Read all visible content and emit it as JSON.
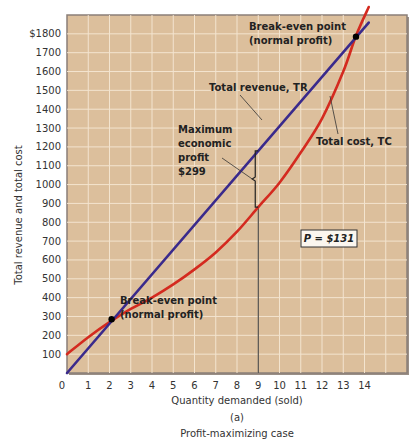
{
  "chart_data": {
    "type": "line",
    "title": "Profit-maximizing case",
    "panel_label": "(a)",
    "xlabel": "Quantity demanded (sold)",
    "ylabel": "Total revenue and total cost",
    "xlim": [
      0,
      16
    ],
    "ylim": [
      0,
      1900
    ],
    "x_ticks": [
      "0",
      "1",
      "2",
      "3",
      "4",
      "5",
      "6",
      "7",
      "8",
      "9",
      "10",
      "11",
      "12",
      "13",
      "14"
    ],
    "y_ticks": [
      "100",
      "200",
      "300",
      "400",
      "500",
      "600",
      "700",
      "800",
      "900",
      "1000",
      "1100",
      "1200",
      "1300",
      "1400",
      "1500",
      "1600",
      "1700",
      "$1800"
    ],
    "grid": true,
    "background_color": "#dcbf9c",
    "series": [
      {
        "name": "Total revenue, TR",
        "color": "#3a2a8c",
        "x": [
          0,
          14.2
        ],
        "y": [
          0,
          1860
        ]
      },
      {
        "name": "Total cost, TC",
        "color": "#d42a1f",
        "x": [
          0,
          1,
          2,
          3,
          4,
          5,
          6,
          7,
          8,
          9,
          10,
          11,
          12,
          13,
          13.6,
          14.2
        ],
        "y": [
          100,
          190,
          270,
          340,
          400,
          470,
          550,
          640,
          750,
          880,
          1010,
          1170,
          1350,
          1600,
          1790,
          1960
        ]
      }
    ],
    "annotations": {
      "price_box": "P = $131",
      "break_even_low": {
        "line1": "Break-even point",
        "line2": "(normal profit)",
        "x": 2.1,
        "y": 285
      },
      "break_even_high": {
        "line1": "Break-even point",
        "line2": "(normal profit)",
        "x": 13.6,
        "y": 1785
      },
      "max_profit": {
        "line1": "Maximum",
        "line2": "economic",
        "line3": "profit",
        "line4": "$299",
        "x": 9,
        "tr": 1179,
        "tc": 880
      },
      "tr_label": "Total revenue, TR",
      "tc_label": "Total cost, TC"
    }
  }
}
